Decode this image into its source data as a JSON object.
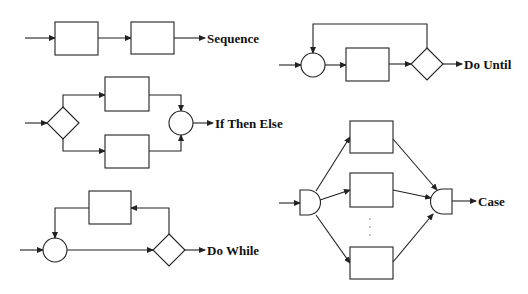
{
  "diagram": {
    "constructs": [
      {
        "id": "sequence",
        "label": "Sequence"
      },
      {
        "id": "do-until",
        "label": "Do Until"
      },
      {
        "id": "if-then-else",
        "label": "If Then Else"
      },
      {
        "id": "case",
        "label": "Case"
      },
      {
        "id": "do-while",
        "label": "Do While"
      }
    ],
    "colors": {
      "stroke": "#222222",
      "background": "#ffffff",
      "text": "#111111"
    }
  }
}
